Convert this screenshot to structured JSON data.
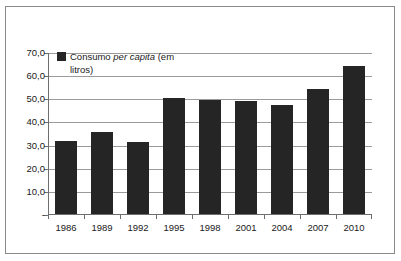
{
  "chart_data": {
    "type": "bar",
    "title": "",
    "subtitle": "",
    "xlabel": "",
    "ylabel": "",
    "categories": [
      "1986",
      "1989",
      "1992",
      "1995",
      "1998",
      "2001",
      "2004",
      "2007",
      "2010"
    ],
    "values": [
      31.5,
      35.5,
      31.0,
      50.3,
      49.4,
      49.0,
      47.2,
      54.2,
      64.0
    ],
    "series": [
      {
        "name": "Consumo per capita (em litros)",
        "values": [
          31.5,
          35.5,
          31.0,
          50.3,
          49.4,
          49.0,
          47.2,
          54.2,
          64.0
        ]
      }
    ],
    "ylim": [
      0,
      70
    ],
    "ytick_values": [
      0,
      10,
      20,
      30,
      40,
      50,
      60,
      70
    ],
    "ytick_labels": [
      "-",
      "10,0",
      "20,0",
      "30,0",
      "40,0",
      "50,0",
      "60,0",
      "70,0"
    ],
    "grid": true,
    "legend_position": "top-left",
    "bar_color": "#252525",
    "grid_color": "#9b9b9b",
    "axis_color": "#6e6e6e",
    "decimal_separator": ","
  },
  "legend": {
    "swatch_name": "legend-color-swatch",
    "text_part1": "Consumo ",
    "text_italic": "per capita",
    "text_part2": " (em litros)",
    "full_text": "Consumo per capita (em litros)"
  }
}
